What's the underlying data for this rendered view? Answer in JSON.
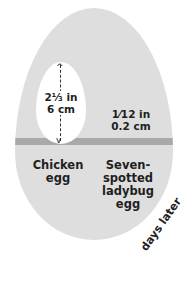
{
  "diagram": {
    "chicken_egg": {
      "size_in": "2⅓ in",
      "size_cm": "6 cm",
      "name": "Chicken egg"
    },
    "ladybug_egg": {
      "size_in": "1⁄12 in",
      "size_cm": "0.2 cm",
      "name": "Seven-spotted ladybug egg"
    },
    "curved_text": "days later",
    "colors": {
      "big_egg": "#dedede",
      "band": "#a9a9a9",
      "chicken_egg": "#ffffff",
      "text": "#1f1f1f"
    }
  }
}
